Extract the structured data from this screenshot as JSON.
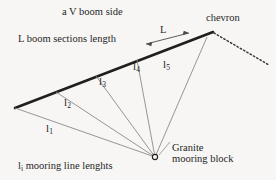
{
  "figure": {
    "title": "a V boom side",
    "background_color": "#f7f6f4",
    "ink_color": "#262626",
    "boom_color": "#1f1f1f",
    "mooring_line_color": "#8a8a8a"
  },
  "labels": {
    "chevron": "chevron",
    "boom_sections_length": "L boom sections length",
    "section_length_symbol": "L",
    "mooring_line_lengths_prefix": "l",
    "mooring_line_lengths_subscript": "i",
    "mooring_line_lengths_rest": " mooring line lenghts",
    "granite_line1": "Granite",
    "granite_line2": "mooring block"
  },
  "mooring_lines": [
    {
      "name": "l1",
      "symbol": "l",
      "subscript": "1"
    },
    {
      "name": "l2",
      "symbol": "l",
      "subscript": "2"
    },
    {
      "name": "l3",
      "symbol": "l",
      "subscript": "3"
    },
    {
      "name": "l4",
      "symbol": "l",
      "subscript": "4"
    },
    {
      "name": "l5",
      "symbol": "l",
      "subscript": "5"
    }
  ]
}
